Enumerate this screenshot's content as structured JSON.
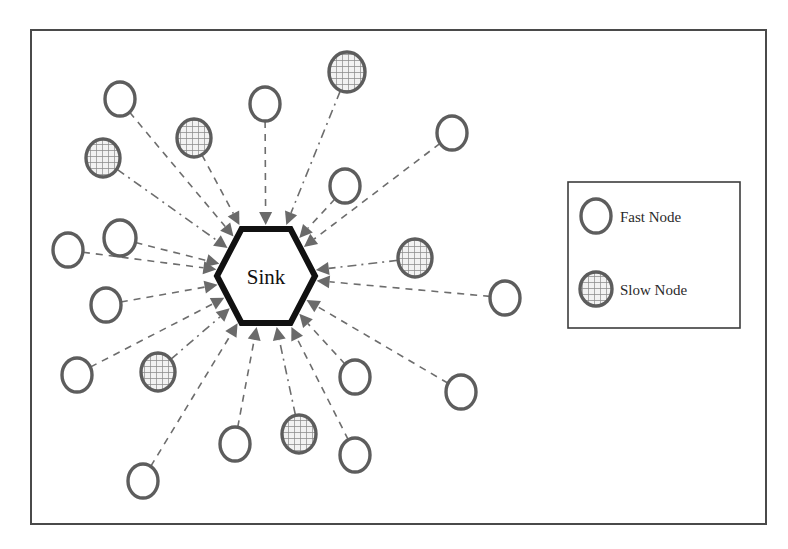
{
  "figure": {
    "title": "",
    "frame": {
      "x": 31,
      "y": 30,
      "width": 735,
      "height": 494,
      "stroke": "#4a4a4a",
      "stroke_width": 2
    },
    "background": "#ffffff"
  },
  "colors": {
    "node_outline": "#5d5d5d",
    "fast_node_fill": "#ffffff",
    "slow_node_fill": "#e8e8e8",
    "slow_node_hatch": "#7a7a7a",
    "sink_outline": "#111111",
    "sink_fill": "#ffffff",
    "link_stroke": "#6d6d6d",
    "arrow_fill": "#6a6a6a",
    "legend_border": "#3d3d3d",
    "text": "#1a1a1a"
  },
  "sink": {
    "label": "Sink",
    "cx": 266,
    "cy": 276,
    "rx": 49,
    "ry": 47,
    "shape": "hexagon",
    "stroke_width": 6
  },
  "legend": {
    "box": {
      "x": 568,
      "y": 182,
      "width": 172,
      "height": 146
    },
    "items": [
      {
        "type": "fast",
        "label": "Fast Node",
        "marker_cx": 596,
        "marker_cy": 216
      },
      {
        "type": "slow",
        "label": "Slow Node",
        "marker_cx": 596,
        "marker_cy": 289
      }
    ]
  },
  "nodes": [
    {
      "id": "n1",
      "type": "fast",
      "cx": 120,
      "cy": 99,
      "rx": 15,
      "ry": 17,
      "label": ""
    },
    {
      "id": "n2",
      "type": "slow",
      "cx": 194,
      "cy": 138,
      "rx": 17,
      "ry": 19,
      "label": ""
    },
    {
      "id": "n3",
      "type": "slow",
      "cx": 103,
      "cy": 158,
      "rx": 17,
      "ry": 19,
      "label": ""
    },
    {
      "id": "n4",
      "type": "fast",
      "cx": 265,
      "cy": 104,
      "rx": 15,
      "ry": 17,
      "label": ""
    },
    {
      "id": "n5",
      "type": "slow",
      "cx": 347,
      "cy": 72,
      "rx": 18,
      "ry": 20,
      "label": ""
    },
    {
      "id": "n6",
      "type": "fast",
      "cx": 345,
      "cy": 186,
      "rx": 15,
      "ry": 17,
      "label": ""
    },
    {
      "id": "n7",
      "type": "fast",
      "cx": 452,
      "cy": 133,
      "rx": 15,
      "ry": 17,
      "label": ""
    },
    {
      "id": "n8",
      "type": "fast",
      "cx": 68,
      "cy": 250,
      "rx": 15,
      "ry": 17,
      "label": ""
    },
    {
      "id": "n9",
      "type": "fast",
      "cx": 120,
      "cy": 238,
      "rx": 16,
      "ry": 18,
      "label": ""
    },
    {
      "id": "n10",
      "type": "fast",
      "cx": 106,
      "cy": 305,
      "rx": 15,
      "ry": 17,
      "label": ""
    },
    {
      "id": "n11",
      "type": "fast",
      "cx": 77,
      "cy": 375,
      "rx": 15,
      "ry": 17,
      "label": ""
    },
    {
      "id": "n12",
      "type": "slow",
      "cx": 158,
      "cy": 372,
      "rx": 17,
      "ry": 19,
      "label": ""
    },
    {
      "id": "n13",
      "type": "slow",
      "cx": 415,
      "cy": 258,
      "rx": 17,
      "ry": 19,
      "label": ""
    },
    {
      "id": "n14",
      "type": "fast",
      "cx": 505,
      "cy": 298,
      "rx": 15,
      "ry": 17,
      "label": ""
    },
    {
      "id": "n15",
      "type": "fast",
      "cx": 355,
      "cy": 377,
      "rx": 15,
      "ry": 17,
      "label": ""
    },
    {
      "id": "n16",
      "type": "fast",
      "cx": 461,
      "cy": 392,
      "rx": 15,
      "ry": 17,
      "label": ""
    },
    {
      "id": "n17",
      "type": "fast",
      "cx": 143,
      "cy": 481,
      "rx": 15,
      "ry": 17,
      "label": ""
    },
    {
      "id": "n18",
      "type": "fast",
      "cx": 235,
      "cy": 444,
      "rx": 15,
      "ry": 17,
      "label": ""
    },
    {
      "id": "n19",
      "type": "slow",
      "cx": 299,
      "cy": 434,
      "rx": 17,
      "ry": 19,
      "label": ""
    },
    {
      "id": "n20",
      "type": "fast",
      "cx": 355,
      "cy": 455,
      "rx": 15,
      "ry": 17,
      "label": ""
    }
  ],
  "links": [
    {
      "from": "n1",
      "to": "sink",
      "style": "dashed"
    },
    {
      "from": "n2",
      "to": "sink",
      "style": "dashed"
    },
    {
      "from": "n3",
      "to": "sink",
      "style": "dashdot"
    },
    {
      "from": "n4",
      "to": "sink",
      "style": "dashed"
    },
    {
      "from": "n5",
      "to": "sink",
      "style": "dashdot"
    },
    {
      "from": "n6",
      "to": "sink",
      "style": "dashed"
    },
    {
      "from": "n7",
      "to": "sink",
      "style": "dashed"
    },
    {
      "from": "n8",
      "to": "sink",
      "style": "dashed"
    },
    {
      "from": "n9",
      "to": "sink",
      "style": "dashed"
    },
    {
      "from": "n10",
      "to": "sink",
      "style": "dashed"
    },
    {
      "from": "n11",
      "to": "sink",
      "style": "dashed"
    },
    {
      "from": "n12",
      "to": "sink",
      "style": "dashdot"
    },
    {
      "from": "n13",
      "to": "sink",
      "style": "dashdot"
    },
    {
      "from": "n14",
      "to": "sink",
      "style": "dashed"
    },
    {
      "from": "n15",
      "to": "sink",
      "style": "dashed"
    },
    {
      "from": "n16",
      "to": "sink",
      "style": "dashed"
    },
    {
      "from": "n17",
      "to": "sink",
      "style": "dashed"
    },
    {
      "from": "n18",
      "to": "sink",
      "style": "dashed"
    },
    {
      "from": "n19",
      "to": "sink",
      "style": "dashdot"
    },
    {
      "from": "n20",
      "to": "sink",
      "style": "dashed"
    }
  ]
}
